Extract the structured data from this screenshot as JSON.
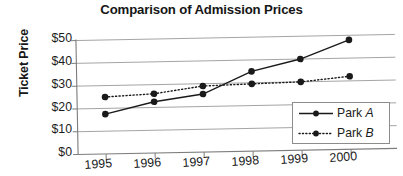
{
  "chart_data": {
    "type": "line",
    "title": "Comparison of Admission Prices",
    "xlabel": "",
    "ylabel": "Ticket Price",
    "categories": [
      "1995",
      "1996",
      "1997",
      "1998",
      "1999",
      "2000"
    ],
    "x": [
      1995,
      1996,
      1997,
      1998,
      1999,
      2000
    ],
    "series": [
      {
        "name": "Park A",
        "values": [
          17.5,
          22.5,
          25.5,
          35,
          40,
          48
        ],
        "style": "solid",
        "marker": "filled-circle",
        "color": "#1a1a1a"
      },
      {
        "name": "Park B",
        "values": [
          25,
          26,
          29,
          29.5,
          30,
          32
        ],
        "style": "dotted",
        "marker": "filled-circle",
        "color": "#1a1a1a"
      }
    ],
    "ylim": [
      0,
      50
    ],
    "ytick_values": [
      0,
      10,
      20,
      30,
      40,
      50
    ],
    "ytick_labels": [
      "$0",
      "$10",
      "$20",
      "$30",
      "$40",
      "$50"
    ],
    "grid": "horizontal",
    "legend_position": "lower-right",
    "legend_entries": [
      "Park A",
      "Park B"
    ],
    "axis_color": "#8c8c8c",
    "line_color": "#1a1a1a"
  },
  "legend": {
    "items": [
      {
        "prefix": "Park ",
        "suffix": "A"
      },
      {
        "prefix": "Park ",
        "suffix": "B"
      }
    ]
  }
}
